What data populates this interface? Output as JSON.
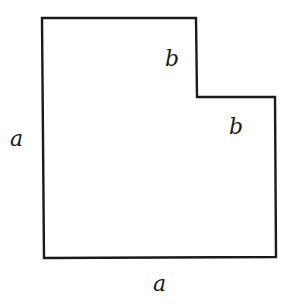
{
  "diagram": {
    "shape": {
      "type": "L-shaped polygon (square with top-right corner square removed)",
      "points": [
        [
          42,
          18
        ],
        [
          196,
          18
        ],
        [
          197,
          97
        ],
        [
          275,
          97
        ],
        [
          276,
          257
        ],
        [
          44,
          258
        ]
      ],
      "stroke": "#1a1a1a",
      "stroke_width": 2.4
    },
    "labels": {
      "left_side": "a",
      "bottom_side": "a",
      "notch_vertical": "b",
      "notch_horizontal": "b"
    }
  }
}
